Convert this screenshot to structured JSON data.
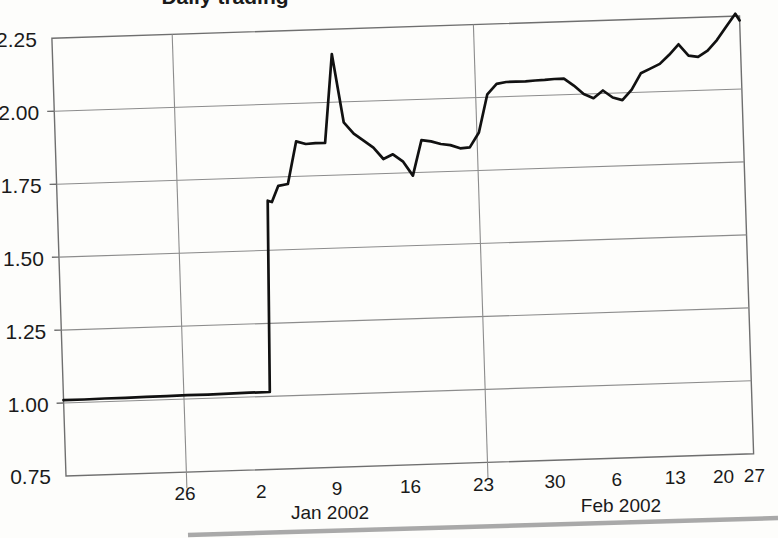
{
  "chart_data": {
    "type": "line",
    "title": "Daily trading",
    "title_clipped": true,
    "xlabel": "",
    "ylabel": "",
    "ylim": [
      0.75,
      2.25
    ],
    "yticks": [
      "0.75",
      "1.00",
      "1.25",
      "1.50",
      "1.75",
      "2.00",
      "2.25"
    ],
    "ytick_values": [
      0.75,
      1.0,
      1.25,
      1.5,
      1.75,
      2.0,
      2.25
    ],
    "xticks": [
      "26",
      "2",
      "9",
      "16",
      "23",
      "30",
      "6",
      "13",
      "20",
      "27"
    ],
    "xtick_positions": [
      0.172,
      0.283,
      0.393,
      0.5,
      0.606,
      0.71,
      0.8,
      0.885,
      0.955,
      1.0
    ],
    "x_group_labels": [
      "Jan 2002",
      "Feb 2002"
    ],
    "grid": {
      "horizontal": true,
      "vertical": true,
      "vertical_count": 2
    },
    "legend": "none",
    "series": [
      {
        "name": "price",
        "x": [
          0.0,
          0.03,
          0.06,
          0.09,
          0.12,
          0.15,
          0.18,
          0.21,
          0.24,
          0.27,
          0.3,
          0.306,
          0.312,
          0.322,
          0.336,
          0.35,
          0.364,
          0.378,
          0.392,
          0.406,
          0.42,
          0.434,
          0.448,
          0.462,
          0.476,
          0.49,
          0.504,
          0.518,
          0.532,
          0.546,
          0.56,
          0.574,
          0.588,
          0.602,
          0.616,
          0.63,
          0.644,
          0.658,
          0.672,
          0.686,
          0.7,
          0.714,
          0.728,
          0.742,
          0.756,
          0.77,
          0.784,
          0.798,
          0.812,
          0.826,
          0.84,
          0.854,
          0.868,
          0.882,
          0.896,
          0.91,
          0.924,
          0.938,
          0.952,
          0.966,
          0.98,
          0.994,
          1.0
        ],
        "y": [
          1.01,
          1.01,
          1.011,
          1.011,
          1.012,
          1.012,
          1.013,
          1.013,
          1.014,
          1.015,
          1.015,
          1.67,
          1.665,
          1.72,
          1.725,
          1.87,
          1.86,
          1.862,
          1.862,
          2.165,
          1.93,
          1.89,
          1.865,
          1.84,
          1.8,
          1.815,
          1.79,
          1.74,
          1.86,
          1.855,
          1.845,
          1.84,
          1.828,
          1.83,
          1.88,
          2.01,
          2.045,
          2.05,
          2.05,
          2.05,
          2.052,
          2.053,
          2.055,
          2.055,
          2.03,
          2.0,
          1.985,
          2.01,
          1.985,
          1.975,
          2.01,
          2.065,
          2.08,
          2.095,
          2.125,
          2.16,
          2.12,
          2.115,
          2.135,
          2.17,
          2.215,
          2.258,
          2.235
        ]
      }
    ],
    "annotations": [],
    "colors": {
      "line": "#111111",
      "grid": "#8c8c8c",
      "axis": "#6f6f6f",
      "text": "#1a1a1a",
      "background": "#fdfdfb"
    }
  }
}
